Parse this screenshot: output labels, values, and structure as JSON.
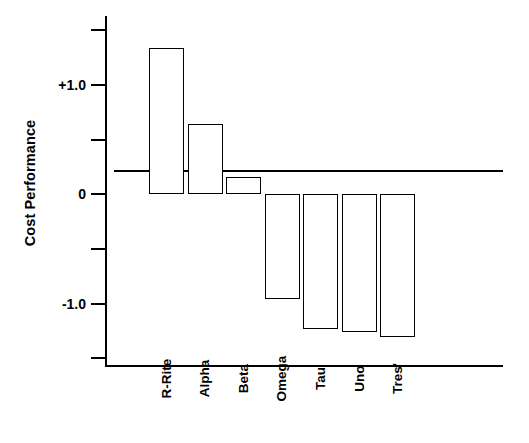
{
  "chart_data": {
    "type": "bar",
    "title": "",
    "xlabel": "",
    "ylabel": "Cost Performance",
    "categories": [
      "R-Rite",
      "Alpha",
      "Beta",
      "Omega",
      "Tau",
      "Uno",
      "Tres'"
    ],
    "values": [
      1.34,
      0.64,
      0.16,
      -0.96,
      -1.23,
      -1.26,
      -1.31
    ],
    "ylim": [
      -1.58,
      1.63
    ],
    "ytick_values": [
      1.5,
      1.0,
      0.5,
      0.0,
      -0.5,
      -1.0,
      -1.5
    ],
    "ytick_labels": [
      "",
      "+1.0",
      "",
      "0",
      "",
      "-1.0",
      ""
    ],
    "grid": false,
    "legend": null,
    "zero_line": 0,
    "bar_fill": "#ffffff",
    "bar_edge": "#000000",
    "axis_color": "#000000",
    "background": "#ffffff"
  },
  "axis": {
    "ylabel_text": "Cost Performance",
    "tick_plus_one": "+1.0",
    "tick_zero": "0",
    "tick_minus_one": "-1.0"
  },
  "categories": {
    "c0": "R-Rite",
    "c1": "Alpha",
    "c2": "Beta",
    "c3": "Omega",
    "c4": "Tau",
    "c5": "Uno",
    "c6": "Tres'"
  }
}
